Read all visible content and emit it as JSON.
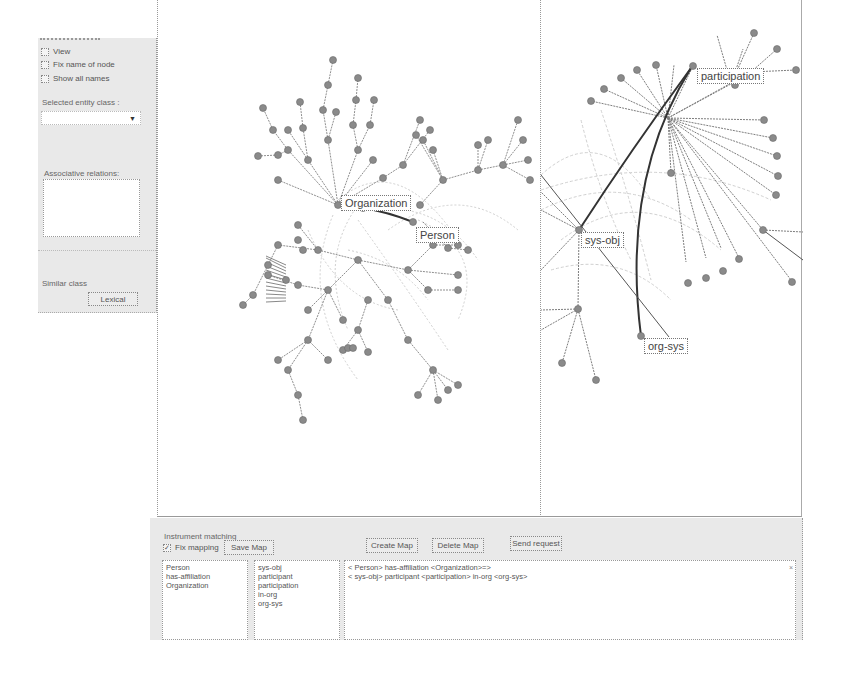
{
  "sidebar": {
    "checkboxes": [
      {
        "label": "View",
        "checked": false
      },
      {
        "label": "Fix name of node",
        "checked": false
      },
      {
        "label": "Show all names",
        "checked": false
      }
    ],
    "selected_entity_class_label": "Selected entity class :",
    "selected_entity_class_value": "",
    "dropdown_arrow": "▼",
    "associative_relations_label": "Associative relations:",
    "associative_relations_items": [],
    "similar_class_label": "Similar class",
    "lexical_button": "Lexical"
  },
  "left_graph": {
    "labels": [
      {
        "text": "Organization"
      },
      {
        "text": "Person"
      }
    ]
  },
  "right_graph": {
    "labels": [
      {
        "text": "participation"
      },
      {
        "text": "sys-obj"
      },
      {
        "text": "org-sys"
      }
    ]
  },
  "bottom": {
    "section_label": "Instrument matching",
    "fix_mapping_label": "Fix mapping",
    "fix_mapping_checked": true,
    "check_glyph": "✓",
    "save_map_button": "Save Map",
    "create_map_button": "Create Map",
    "delete_map_button": "Delete Map",
    "send_request_button": "Send request",
    "list1": [
      "Person",
      "has-affiliation",
      "Organization"
    ],
    "list2": [
      "sys-obj",
      "participant",
      "participation",
      "in-org",
      "org-sys"
    ],
    "queries": [
      "< Person> has-affiliation <Organization>=>",
      "< sys-obj> participant <participation> in-org <org-sys>"
    ],
    "close_glyph": "×"
  },
  "colors": {
    "panel_bg": "#e9e9e9",
    "node": "#8a8a8a",
    "edge": "#9a9a9a",
    "edge_strong": "#333333"
  }
}
